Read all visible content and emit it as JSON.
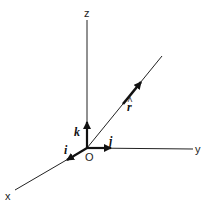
{
  "diagram": {
    "title": "",
    "axes": {
      "x": {
        "label": "x"
      },
      "y": {
        "label": "y"
      },
      "z": {
        "label": "z"
      }
    },
    "origin": {
      "label": "O"
    },
    "unit_vectors": [
      {
        "name": "i",
        "label": "i",
        "direction": "x"
      },
      {
        "name": "j",
        "label": "j",
        "direction": "y"
      },
      {
        "name": "k",
        "label": "k",
        "direction": "z"
      },
      {
        "name": "r_hat",
        "label": "r",
        "hat": "^",
        "direction": "r"
      }
    ],
    "colors": {
      "line": "#222222",
      "background": "#ffffff"
    }
  }
}
